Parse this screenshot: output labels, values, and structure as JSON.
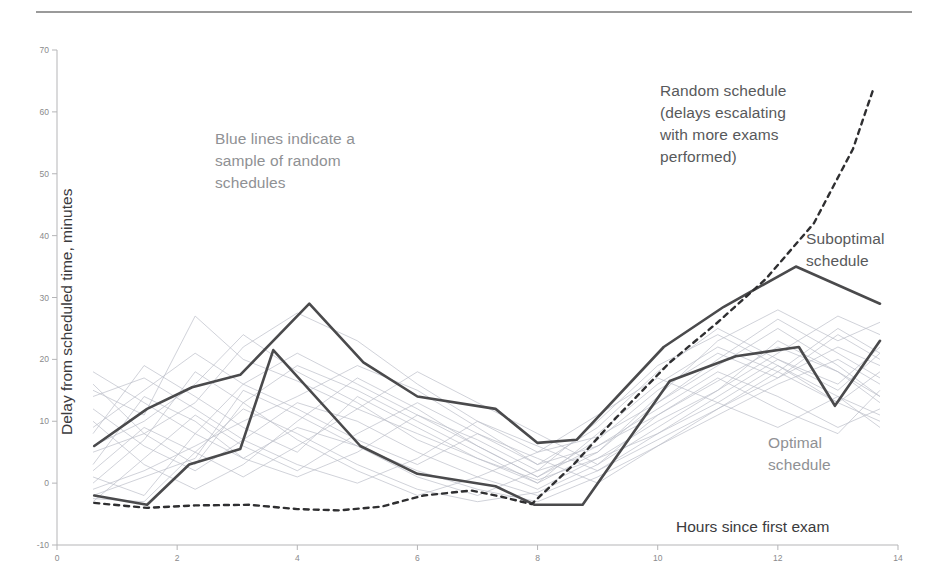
{
  "figure": {
    "background": "#ffffff",
    "rule_color": "#9a9a9a"
  },
  "annotations": {
    "blue_lines": "Blue lines indicate a\nsample of random\nschedules",
    "random_schedule": "Random schedule\n(delays escalating\nwith more exams\nperformed)",
    "suboptimal_schedule": "Suboptimal\nschedule",
    "optimal_schedule": "Optimal\nschedule"
  },
  "chart_data": {
    "type": "line",
    "title": "",
    "subtitle": "",
    "xlabel": "Hours since first exam",
    "ylabel": "Delay from scheduled time, minutes",
    "xlim": [
      0,
      14
    ],
    "ylim": [
      -10,
      70
    ],
    "xticks": [
      0,
      2,
      4,
      6,
      8,
      10,
      12,
      14
    ],
    "yticks": [
      -10,
      0,
      10,
      20,
      30,
      40,
      50,
      60,
      70
    ],
    "grid": false,
    "legend_position": "annotations-inline",
    "colors": {
      "suboptimal": "#4a4a4c",
      "optimal": "#4a4a4c",
      "random_mean": "#2f2f31",
      "random_sample": "#b9bdc6",
      "axis": "#b5b5b7",
      "tick_text": "#8a8a8c",
      "annotation_dark": "#58595b",
      "annotation_light": "#8f9194"
    },
    "series": [
      {
        "name": "Suboptimal schedule",
        "style": "solid",
        "width": 2.6,
        "color": "#4a4a4c",
        "x": [
          0.62,
          1.5,
          2.25,
          3.05,
          4.2,
          5.1,
          6.0,
          7.3,
          8.0,
          8.65,
          10.1,
          11.1,
          12.3,
          13.7
        ],
        "y": [
          6.0,
          12.0,
          15.5,
          17.5,
          29.0,
          19.5,
          14.0,
          12.0,
          6.5,
          7.0,
          22.0,
          28.5,
          35.0,
          29.0
        ]
      },
      {
        "name": "Optimal schedule",
        "style": "solid",
        "width": 2.6,
        "color": "#4a4a4c",
        "x": [
          0.62,
          1.5,
          2.2,
          3.05,
          3.6,
          5.05,
          6.0,
          7.3,
          7.95,
          8.75,
          10.2,
          11.3,
          12.35,
          12.95,
          13.7
        ],
        "y": [
          -2.0,
          -3.5,
          3.0,
          5.5,
          21.5,
          6.0,
          1.5,
          -0.5,
          -3.5,
          -3.5,
          16.5,
          20.5,
          22.0,
          12.5,
          23.0
        ]
      },
      {
        "name": "Random schedule (delays escalating with more exams performed)",
        "style": "dashed",
        "width": 2.4,
        "color": "#2f2f31",
        "x": [
          0.62,
          1.5,
          2.3,
          3.2,
          4.0,
          4.7,
          5.4,
          6.1,
          6.9,
          7.4,
          7.9,
          8.6,
          9.3,
          10.2,
          11.0,
          11.8,
          12.6,
          13.25,
          13.6
        ],
        "y": [
          -3.2,
          -4.0,
          -3.6,
          -3.5,
          -4.2,
          -4.4,
          -3.8,
          -2.0,
          -1.2,
          -2.2,
          -3.4,
          3.0,
          10.5,
          19.5,
          26.0,
          33.0,
          42.0,
          54.0,
          64.0
        ]
      }
    ],
    "sample_series": {
      "name": "Sample of random schedules",
      "style": "solid",
      "width": 0.8,
      "color": "#b9bdc6",
      "count": 18,
      "lines": [
        {
          "x": [
            0.6,
            1.45,
            2.3,
            3.1,
            4.0,
            5.0,
            6.0,
            7.0,
            8.0,
            9.0,
            10.0,
            11.0,
            12.0,
            13.0,
            13.7
          ],
          "y": [
            15.0,
            11.0,
            27.0,
            20.0,
            16.5,
            12.0,
            8.0,
            4.0,
            0.5,
            4.0,
            8.0,
            13.0,
            19.0,
            14.0,
            9.0
          ]
        },
        {
          "x": [
            0.6,
            1.45,
            2.3,
            3.1,
            4.0,
            5.0,
            6.0,
            7.0,
            8.0,
            9.0,
            10.0,
            11.0,
            12.0,
            13.0,
            13.7
          ],
          "y": [
            5.0,
            8.0,
            13.0,
            22.0,
            27.5,
            23.0,
            16.0,
            10.0,
            5.0,
            7.5,
            13.0,
            20.0,
            26.5,
            21.0,
            17.0
          ]
        },
        {
          "x": [
            0.6,
            1.45,
            2.3,
            3.1,
            4.0,
            5.0,
            6.0,
            7.0,
            8.0,
            9.0,
            10.0,
            11.0,
            12.0,
            13.0,
            13.7
          ],
          "y": [
            -1.0,
            2.0,
            6.0,
            10.0,
            14.0,
            19.0,
            15.0,
            9.0,
            3.0,
            6.0,
            11.0,
            16.5,
            22.0,
            18.0,
            14.0
          ]
        },
        {
          "x": [
            0.6,
            1.45,
            2.3,
            3.1,
            4.0,
            5.0,
            6.0,
            7.0,
            8.0,
            9.0,
            10.0,
            11.0,
            12.0,
            13.0,
            13.7
          ],
          "y": [
            12.0,
            6.0,
            2.0,
            7.0,
            13.0,
            10.0,
            5.0,
            1.0,
            -2.0,
            2.0,
            7.0,
            12.0,
            17.0,
            24.0,
            20.0
          ]
        },
        {
          "x": [
            0.6,
            1.45,
            2.3,
            3.1,
            4.0,
            5.0,
            6.0,
            7.0,
            8.0,
            9.0,
            10.0,
            11.0,
            12.0,
            13.0,
            13.7
          ],
          "y": [
            3.0,
            14.0,
            10.0,
            4.0,
            1.0,
            5.0,
            11.0,
            7.0,
            2.0,
            5.0,
            14.0,
            23.0,
            28.0,
            23.0,
            26.0
          ]
        },
        {
          "x": [
            0.6,
            1.45,
            2.3,
            3.1,
            4.0,
            5.0,
            6.0,
            7.0,
            8.0,
            9.0,
            10.0,
            11.0,
            12.0,
            13.0,
            13.7
          ],
          "y": [
            -2.5,
            -3.0,
            5.0,
            12.0,
            8.0,
            3.0,
            -1.0,
            -3.0,
            -1.5,
            3.0,
            9.0,
            15.0,
            21.0,
            27.0,
            24.0
          ]
        },
        {
          "x": [
            0.6,
            1.45,
            2.3,
            3.1,
            4.0,
            5.0,
            6.0,
            7.0,
            8.0,
            9.0,
            10.0,
            11.0,
            12.0,
            13.0,
            13.7
          ],
          "y": [
            8.0,
            19.0,
            14.0,
            9.0,
            5.0,
            14.0,
            9.0,
            4.0,
            0.0,
            8.0,
            16.0,
            22.0,
            18.0,
            13.0,
            18.0
          ]
        },
        {
          "x": [
            0.6,
            1.45,
            2.3,
            3.1,
            4.0,
            5.0,
            6.0,
            7.0,
            8.0,
            9.0,
            10.0,
            11.0,
            12.0,
            13.0,
            13.7
          ],
          "y": [
            1.0,
            -2.0,
            8.0,
            16.0,
            21.0,
            16.0,
            11.0,
            6.0,
            1.0,
            6.0,
            12.0,
            18.0,
            14.0,
            9.0,
            12.0
          ]
        },
        {
          "x": [
            0.6,
            1.45,
            2.3,
            3.1,
            4.0,
            5.0,
            6.0,
            7.0,
            8.0,
            9.0,
            10.0,
            11.0,
            12.0,
            13.0,
            13.7
          ],
          "y": [
            18.0,
            13.0,
            8.0,
            4.0,
            9.0,
            6.0,
            2.0,
            -1.0,
            -3.0,
            1.0,
            6.0,
            11.0,
            16.0,
            20.0,
            16.0
          ]
        },
        {
          "x": [
            0.6,
            1.45,
            2.3,
            3.1,
            4.0,
            5.0,
            6.0,
            7.0,
            8.0,
            9.0,
            10.0,
            11.0,
            12.0,
            13.0,
            13.7
          ],
          "y": [
            -3.0,
            4.0,
            11.0,
            6.0,
            2.0,
            8.0,
            13.0,
            8.0,
            3.0,
            9.0,
            18.0,
            25.0,
            20.0,
            15.0,
            21.0
          ]
        },
        {
          "x": [
            0.6,
            1.45,
            2.3,
            3.1,
            4.0,
            5.0,
            6.0,
            7.0,
            8.0,
            9.0,
            10.0,
            11.0,
            12.0,
            13.0,
            13.7
          ],
          "y": [
            6.0,
            10.0,
            16.0,
            24.0,
            18.0,
            13.0,
            7.0,
            3.0,
            -1.0,
            4.0,
            10.0,
            15.0,
            23.0,
            18.0,
            13.0
          ]
        },
        {
          "x": [
            0.6,
            1.45,
            2.3,
            3.1,
            4.0,
            5.0,
            6.0,
            7.0,
            8.0,
            9.0,
            10.0,
            11.0,
            12.0,
            13.0,
            13.7
          ],
          "y": [
            10.0,
            3.0,
            -1.0,
            3.0,
            10.0,
            17.0,
            12.0,
            6.0,
            1.0,
            7.0,
            15.0,
            21.0,
            17.0,
            22.0,
            19.0
          ]
        },
        {
          "x": [
            0.6,
            1.45,
            2.3,
            3.1,
            4.0,
            5.0,
            6.0,
            7.0,
            8.0,
            9.0,
            10.0,
            11.0,
            12.0,
            13.0,
            13.7
          ],
          "y": [
            0.0,
            7.0,
            18.0,
            13.0,
            7.0,
            2.0,
            -2.0,
            1.0,
            5.0,
            11.0,
            17.0,
            13.0,
            9.0,
            14.0,
            11.0
          ]
        },
        {
          "x": [
            0.6,
            1.45,
            2.3,
            3.1,
            4.0,
            5.0,
            6.0,
            7.0,
            8.0,
            9.0,
            10.0,
            11.0,
            12.0,
            13.0,
            13.7
          ],
          "y": [
            14.0,
            17.0,
            12.0,
            7.0,
            3.0,
            0.0,
            4.0,
            10.0,
            6.0,
            2.0,
            8.0,
            14.0,
            20.0,
            16.0,
            22.0
          ]
        },
        {
          "x": [
            0.6,
            1.45,
            2.3,
            3.1,
            4.0,
            5.0,
            6.0,
            7.0,
            8.0,
            9.0,
            10.0,
            11.0,
            12.0,
            13.0,
            13.7
          ],
          "y": [
            -2.0,
            1.0,
            4.0,
            15.0,
            11.0,
            6.0,
            1.0,
            -2.0,
            2.0,
            10.0,
            19.0,
            24.0,
            19.0,
            13.0,
            10.0
          ]
        },
        {
          "x": [
            0.6,
            1.45,
            2.3,
            3.1,
            4.0,
            5.0,
            6.0,
            7.0,
            8.0,
            9.0,
            10.0,
            11.0,
            12.0,
            13.0,
            13.7
          ],
          "y": [
            9.0,
            15.0,
            21.0,
            16.0,
            12.0,
            7.0,
            3.0,
            8.0,
            4.0,
            0.0,
            6.0,
            12.0,
            18.0,
            25.0,
            21.0
          ]
        },
        {
          "x": [
            0.6,
            1.45,
            2.3,
            3.1,
            4.0,
            5.0,
            6.0,
            7.0,
            8.0,
            9.0,
            10.0,
            11.0,
            12.0,
            13.0,
            13.7
          ],
          "y": [
            2.0,
            9.0,
            5.0,
            1.0,
            6.0,
            12.0,
            18.0,
            13.0,
            8.0,
            3.0,
            11.0,
            17.0,
            12.0,
            8.0,
            15.0
          ]
        },
        {
          "x": [
            0.6,
            1.45,
            2.3,
            3.1,
            4.0,
            5.0,
            6.0,
            7.0,
            8.0,
            9.0,
            10.0,
            11.0,
            12.0,
            13.0,
            13.7
          ],
          "y": [
            16.0,
            8.0,
            3.0,
            13.0,
            19.0,
            15.0,
            10.0,
            5.0,
            0.0,
            5.0,
            13.0,
            19.0,
            25.0,
            19.0,
            14.0
          ]
        }
      ]
    }
  }
}
